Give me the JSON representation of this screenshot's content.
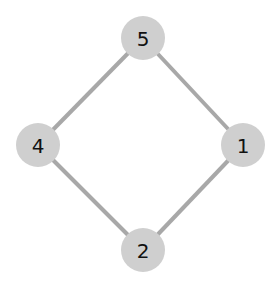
{
  "diagram": {
    "type": "graph",
    "nodes": [
      {
        "id": "5",
        "label": "5",
        "x": 143,
        "y": 38
      },
      {
        "id": "4",
        "label": "4",
        "x": 38,
        "y": 145
      },
      {
        "id": "1",
        "label": "1",
        "x": 243,
        "y": 145
      },
      {
        "id": "2",
        "label": "2",
        "x": 143,
        "y": 250
      }
    ],
    "edges": [
      {
        "from": "5",
        "to": "4"
      },
      {
        "from": "5",
        "to": "1"
      },
      {
        "from": "4",
        "to": "2"
      },
      {
        "from": "1",
        "to": "2"
      }
    ],
    "colors": {
      "node_fill": "#cfcfcf",
      "edge": "#a8a8a8",
      "label": "#111111"
    }
  }
}
